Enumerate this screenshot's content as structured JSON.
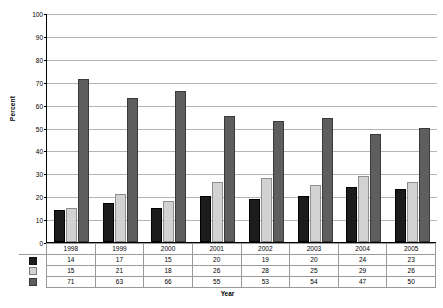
{
  "chart_data": {
    "type": "bar",
    "title": "",
    "xlabel": "Year",
    "ylabel": "Percent",
    "categories": [
      "1998",
      "1999",
      "2000",
      "2001",
      "2002",
      "2003",
      "2004",
      "2005"
    ],
    "series": [
      {
        "name": "series-1",
        "color": "#1c1c1c",
        "values": [
          14,
          17,
          15,
          20,
          19,
          20,
          24,
          23
        ]
      },
      {
        "name": "series-2",
        "color": "#d2d2d2",
        "values": [
          15,
          21,
          18,
          26,
          28,
          25,
          29,
          26
        ]
      },
      {
        "name": "series-3",
        "color": "#5e5e5e",
        "values": [
          71,
          63,
          66,
          55,
          53,
          54,
          47,
          50
        ]
      }
    ],
    "ylim": [
      0,
      100
    ],
    "ytick_step": 10,
    "yticks": [
      0,
      10,
      20,
      30,
      40,
      50,
      60,
      70,
      80,
      90,
      100
    ],
    "ytick_labels": [
      "0",
      "10",
      "20",
      "30",
      "40",
      "50",
      "60",
      "70",
      "80",
      "90",
      "100"
    ],
    "grid": true,
    "grid_axis": "y",
    "legend": "data-table-swatches",
    "data_table_visible": true,
    "bar_orientation": "vertical",
    "grouping": "clustered"
  },
  "axis": {
    "y_title": "Percent",
    "x_title": "Year"
  },
  "colors": {
    "series_1": "#1c1c1c",
    "series_2": "#d2d2d2",
    "series_3": "#5e5e5e",
    "gridline": "#b5b5b5",
    "axis": "#000000",
    "table_border": "#9a9a9a",
    "background": "#ffffff"
  }
}
